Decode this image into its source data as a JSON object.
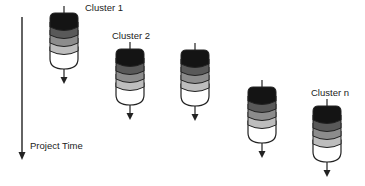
{
  "diagram": {
    "time_axis": {
      "label": "Project Time",
      "x": 22,
      "y1": 17,
      "y2": 160,
      "label_x": 30,
      "label_y": 141
    },
    "layer_colors": [
      "#141414",
      "#595959",
      "#8c8c8c",
      "#bdbdbd",
      "#ffffff"
    ],
    "clusters": [
      {
        "label": "Cluster 1",
        "x": 50,
        "y": 13,
        "label_x": 85,
        "label_y": 3
      },
      {
        "label": "Cluster 2",
        "x": 116,
        "y": 49,
        "label_x": 112,
        "label_y": 31
      },
      {
        "label": "",
        "x": 181,
        "y": 50,
        "label_x": 0,
        "label_y": 0
      },
      {
        "label": "",
        "x": 248,
        "y": 87,
        "label_x": 0,
        "label_y": 0
      },
      {
        "label": "Cluster n",
        "x": 313,
        "y": 106,
        "label_x": 311,
        "label_y": 88
      }
    ]
  }
}
